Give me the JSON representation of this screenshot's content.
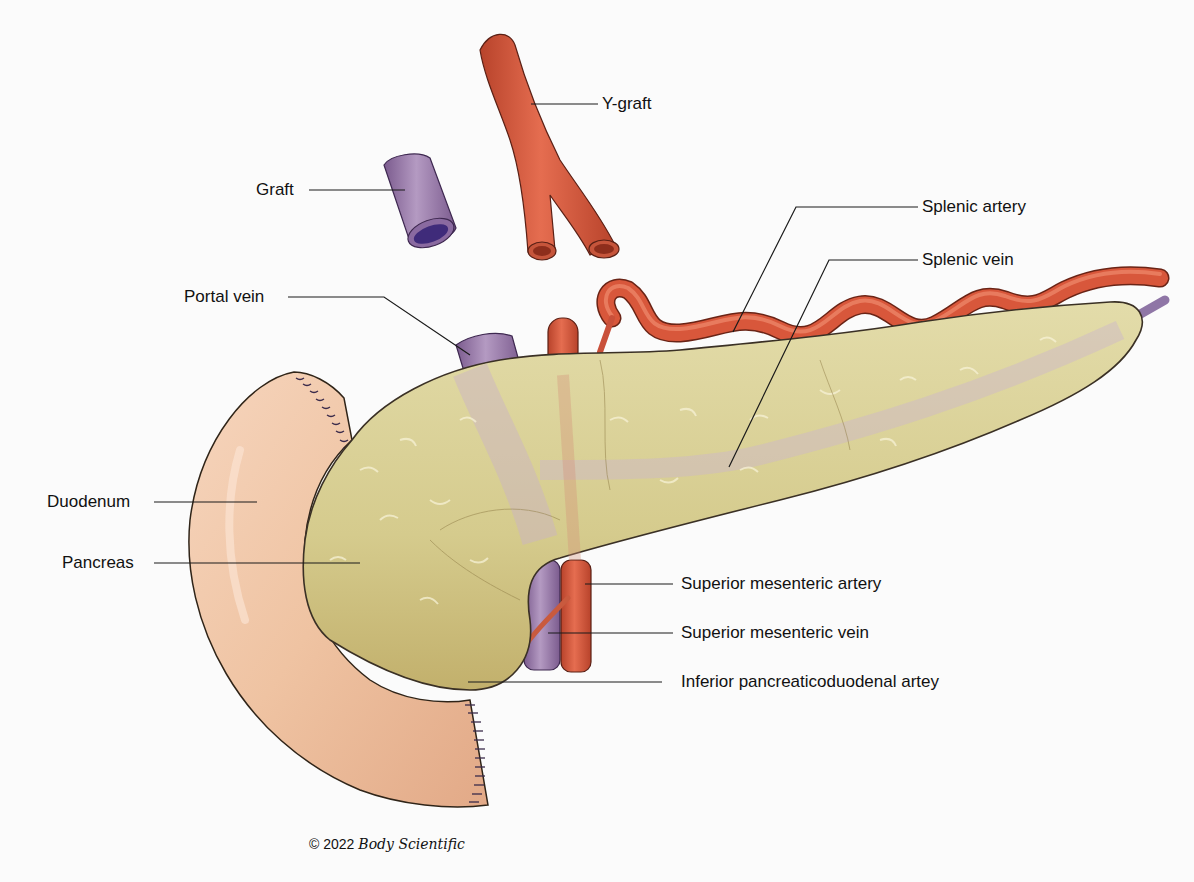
{
  "figure": {
    "type": "anatomical-illustration",
    "colors": {
      "background": "#fbfbfb",
      "artery": "#d9553a",
      "artery_dark": "#a83a24",
      "vein": "#8e6a9e",
      "vein_dark": "#5e3f73",
      "pancreas": "#d8cf94",
      "pancreas_dark": "#b9a865",
      "duodenum": "#f0c6a6",
      "duodenum_dark": "#d9a281",
      "outline": "#3a3025",
      "leader_line": "#1a1a1a"
    }
  },
  "labels": [
    {
      "id": "y-graft",
      "text": "Y-graft"
    },
    {
      "id": "graft",
      "text": "Graft"
    },
    {
      "id": "splenic-artery",
      "text": "Splenic artery"
    },
    {
      "id": "splenic-vein",
      "text": "Splenic vein"
    },
    {
      "id": "portal-vein",
      "text": "Portal vein"
    },
    {
      "id": "duodenum",
      "text": "Duodenum"
    },
    {
      "id": "pancreas",
      "text": "Pancreas"
    },
    {
      "id": "superior-mesenteric-artery",
      "text": "Superior mesenteric artery"
    },
    {
      "id": "superior-mesenteric-vein",
      "text": "Superior mesenteric vein"
    },
    {
      "id": "inferior-pancreaticoduodenal-artery",
      "text": "Inferior pancreaticoduodenal artey"
    }
  ],
  "credit": {
    "copyright": "© 2022",
    "brand": "Body Scientific"
  }
}
